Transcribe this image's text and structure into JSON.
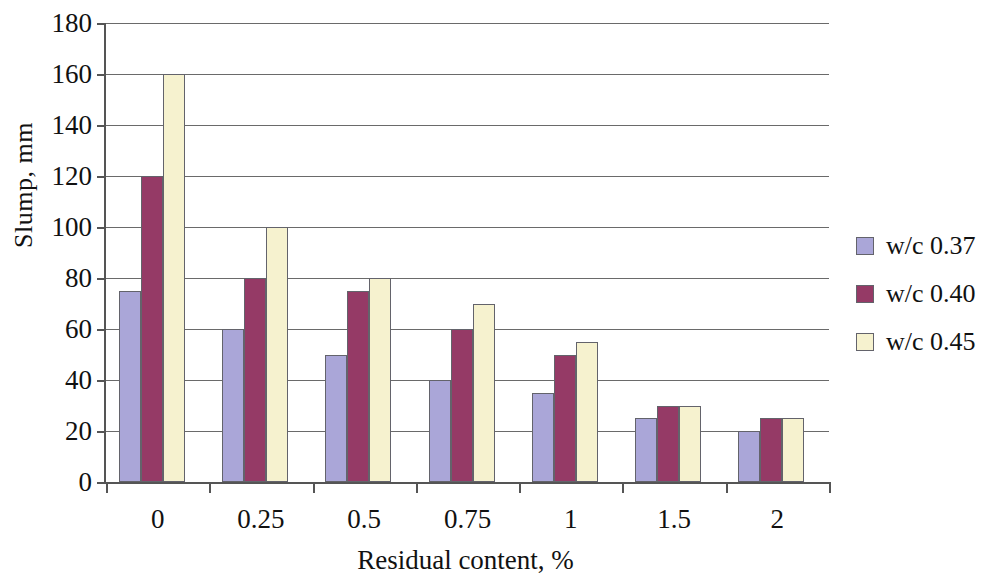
{
  "chart_data": {
    "type": "bar",
    "title": "",
    "xlabel": "Residual content, %",
    "ylabel": "Slump, mm",
    "categories": [
      "0",
      "0.25",
      "0.5",
      "0.75",
      "1",
      "1.5",
      "2"
    ],
    "series": [
      {
        "name": "w/c 0.37",
        "color": "#aaa6d8",
        "values": [
          75,
          60,
          50,
          40,
          35,
          25,
          20
        ]
      },
      {
        "name": "w/c 0.40",
        "color": "#953a66",
        "values": [
          120,
          80,
          75,
          60,
          50,
          30,
          25
        ]
      },
      {
        "name": "w/c 0.45",
        "color": "#f6f2cf",
        "values": [
          160,
          100,
          80,
          70,
          55,
          30,
          25
        ]
      }
    ],
    "ylim": [
      0,
      180
    ],
    "ytick_labels": [
      "0",
      "20",
      "40",
      "60",
      "80",
      "100",
      "120",
      "140",
      "160",
      "180"
    ],
    "ytick_values": [
      0,
      20,
      40,
      60,
      80,
      100,
      120,
      140,
      160,
      180
    ],
    "ytick_step": 20,
    "grid": true,
    "grid_axis": "y",
    "legend_position": "right",
    "axis_color": "#555555",
    "grid_color": "#6a6a6a",
    "bar_border_color": "#63636b",
    "background_color": "#ffffff"
  }
}
